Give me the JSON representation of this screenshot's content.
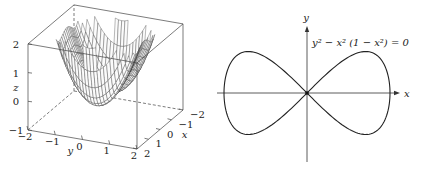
{
  "figure": {
    "left_panel": {
      "type": "surface3d",
      "description": "wireframe surface plot",
      "surface": "z = y^2 - x^2 (1 - x^2), clipped to z range",
      "axes": {
        "x": {
          "label": "x",
          "ticks": [
            "-2",
            "-1",
            "0",
            "1",
            "2"
          ],
          "range": [
            -2,
            2
          ]
        },
        "y": {
          "label": "y",
          "ticks": [
            "-2",
            "-1",
            "0",
            "1",
            "2"
          ],
          "range": [
            -2,
            2
          ]
        },
        "z": {
          "label": "z",
          "ticks": [
            "-1",
            "0",
            "1",
            "2"
          ],
          "range": [
            -1,
            2
          ]
        }
      }
    },
    "right_panel": {
      "type": "implicit_curve",
      "equation": "y² − x² (1 − x²) = 0",
      "x_label": "x",
      "y_label": "y",
      "x_range": [
        -1,
        1
      ],
      "y_range": [
        -0.5,
        0.5
      ]
    }
  },
  "chart_data": [
    {
      "type": "surface",
      "title": "",
      "xlabel": "x",
      "ylabel": "y",
      "zlabel": "z",
      "xlim": [
        -2,
        2
      ],
      "ylim": [
        -2,
        2
      ],
      "zlim": [
        -1,
        2
      ],
      "x_ticks": [
        -2,
        -1,
        0,
        1,
        2
      ],
      "y_ticks": [
        -2,
        -1,
        0,
        1,
        2
      ],
      "z_ticks": [
        -1,
        0,
        1,
        2
      ],
      "function": "z = y^2 - x^2(1 - x^2)"
    },
    {
      "type": "line",
      "title": "y^2 - x^2(1 - x^2) = 0",
      "xlabel": "x",
      "ylabel": "y",
      "xlim": [
        -1,
        1
      ],
      "ylim": [
        -0.5,
        0.5
      ],
      "series": [
        {
          "name": "upper branch",
          "x": [
            -1,
            -0.9,
            -0.707,
            -0.5,
            -0.25,
            0,
            0.25,
            0.5,
            0.707,
            0.9,
            1
          ],
          "y": [
            0,
            0.392,
            0.5,
            0.433,
            0.242,
            0,
            0.242,
            0.433,
            0.5,
            0.392,
            0
          ]
        },
        {
          "name": "lower branch",
          "x": [
            -1,
            -0.9,
            -0.707,
            -0.5,
            -0.25,
            0,
            0.25,
            0.5,
            0.707,
            0.9,
            1
          ],
          "y": [
            0,
            -0.392,
            -0.5,
            -0.433,
            -0.242,
            0,
            -0.242,
            -0.433,
            -0.5,
            -0.392,
            0
          ]
        }
      ],
      "annotations": [
        "y^2 - x^2 (1 - x^2) = 0"
      ]
    }
  ]
}
